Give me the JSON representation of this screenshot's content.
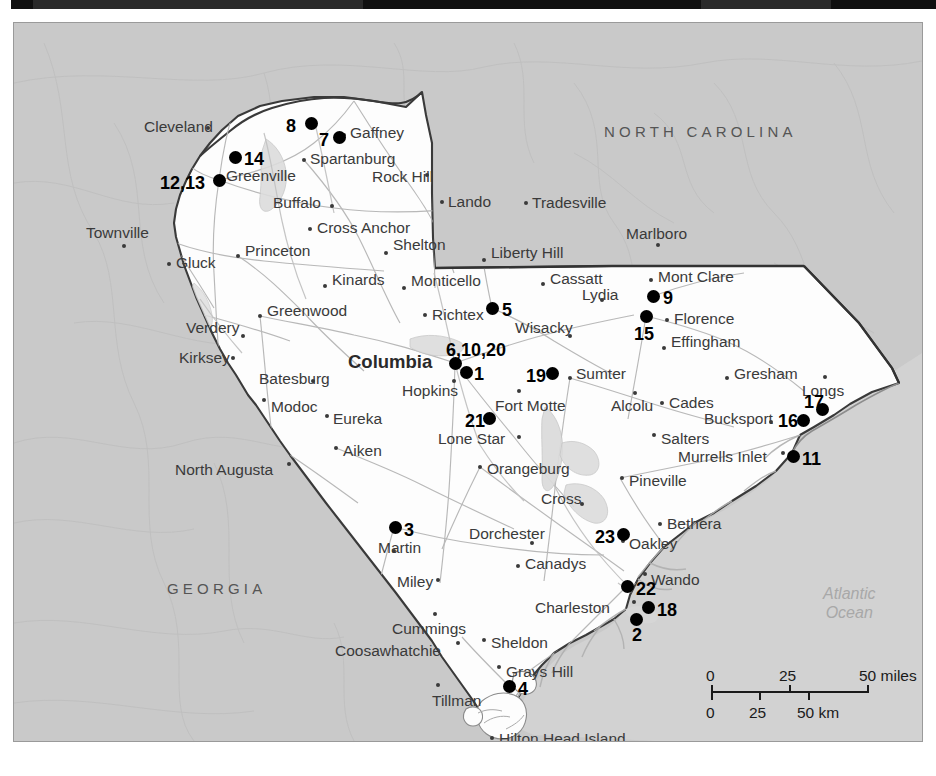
{
  "map": {
    "title": "South Carolina study-site locator map",
    "colors": {
      "land": "#ffffff",
      "surrounding": "#c9c9c9",
      "ocean": "#d6d6d6",
      "border": "#333333",
      "road": "#b9b9b9",
      "marker": "#000000",
      "label": "#3a3a3a"
    },
    "state_labels": [
      {
        "name": "NORTH CAROLINA",
        "x": 590,
        "y": 100
      },
      {
        "name": "GEORGIA",
        "x": 153,
        "y": 557
      }
    ],
    "ocean_label": {
      "line1": "Atlantic",
      "line2": "Ocean",
      "x": 809,
      "y": 561
    },
    "places": [
      {
        "name": "Cleveland",
        "x": 194,
        "y": 105,
        "align": "left",
        "tx": 130,
        "ty": 96
      },
      {
        "name": "Gaffney",
        "x": 330,
        "y": 112,
        "align": "left",
        "tx": 336,
        "ty": 102
      },
      {
        "name": "Spartanburg",
        "x": 290,
        "y": 137,
        "align": "left",
        "tx": 296,
        "ty": 128
      },
      {
        "name": "Greenville",
        "x": 206,
        "y": 155,
        "align": "left",
        "tx": 212,
        "ty": 145
      },
      {
        "name": "Rock Hill",
        "x": 413,
        "y": 152,
        "align": "left",
        "tx": 358,
        "ty": 146
      },
      {
        "name": "Buffalo",
        "x": 318,
        "y": 183,
        "align": "left",
        "tx": 259,
        "ty": 172
      },
      {
        "name": "Lando",
        "x": 428,
        "y": 179,
        "align": "left",
        "tx": 434,
        "ty": 171
      },
      {
        "name": "Tradesville",
        "x": 512,
        "y": 180,
        "align": "left",
        "tx": 518,
        "ty": 172
      },
      {
        "name": "Cross Anchor",
        "x": 296,
        "y": 206,
        "align": "left",
        "tx": 303,
        "ty": 197
      },
      {
        "name": "Marlboro",
        "x": 644,
        "y": 222,
        "align": "left",
        "tx": 612,
        "ty": 203
      },
      {
        "name": "Townville",
        "x": 110,
        "y": 223,
        "align": "left",
        "tx": 72,
        "ty": 202
      },
      {
        "name": "Shelton",
        "x": 372,
        "y": 230,
        "align": "left",
        "tx": 379,
        "ty": 214
      },
      {
        "name": "Liberty Hill",
        "x": 470,
        "y": 237,
        "align": "left",
        "tx": 477,
        "ty": 222
      },
      {
        "name": "Gluck",
        "x": 155,
        "y": 241,
        "align": "left",
        "tx": 162,
        "ty": 232
      },
      {
        "name": "Princeton",
        "x": 224,
        "y": 233,
        "align": "left",
        "tx": 231,
        "ty": 220
      },
      {
        "name": "Mont Clare",
        "x": 637,
        "y": 257,
        "align": "left",
        "tx": 644,
        "ty": 246
      },
      {
        "name": "Kinards",
        "x": 311,
        "y": 263,
        "align": "left",
        "tx": 318,
        "ty": 249
      },
      {
        "name": "Monticello",
        "x": 390,
        "y": 265,
        "align": "left",
        "tx": 397,
        "ty": 250
      },
      {
        "name": "Cassatt",
        "x": 529,
        "y": 261,
        "align": "left",
        "tx": 536,
        "ty": 248
      },
      {
        "name": "Lydia",
        "x": 588,
        "y": 277,
        "align": "left",
        "tx": 568,
        "ty": 264
      },
      {
        "name": "Greenwood",
        "x": 246,
        "y": 293,
        "align": "left",
        "tx": 253,
        "ty": 280
      },
      {
        "name": "Richtex",
        "x": 411,
        "y": 292,
        "align": "left",
        "tx": 418,
        "ty": 284
      },
      {
        "name": "Florence",
        "x": 653,
        "y": 297,
        "align": "left",
        "tx": 660,
        "ty": 288
      },
      {
        "name": "Verdery",
        "x": 229,
        "y": 313,
        "align": "left",
        "tx": 172,
        "ty": 297
      },
      {
        "name": "Wisacky",
        "x": 556,
        "y": 313,
        "align": "left",
        "tx": 501,
        "ty": 297
      },
      {
        "name": "Effingham",
        "x": 650,
        "y": 325,
        "align": "left",
        "tx": 657,
        "ty": 311
      },
      {
        "name": "Kirksey",
        "x": 219,
        "y": 335,
        "align": "left",
        "tx": 165,
        "ty": 327
      },
      {
        "name": "Batesburg",
        "x": 299,
        "y": 358,
        "align": "left",
        "tx": 245,
        "ty": 348
      },
      {
        "name": "Sumter",
        "x": 556,
        "y": 355,
        "align": "left",
        "tx": 562,
        "ty": 343
      },
      {
        "name": "Hopkins",
        "x": 440,
        "y": 358,
        "align": "left",
        "tx": 388,
        "ty": 360
      },
      {
        "name": "Gresham",
        "x": 713,
        "y": 355,
        "align": "left",
        "tx": 720,
        "ty": 343
      },
      {
        "name": "Longs",
        "x": 811,
        "y": 354,
        "align": "left",
        "tx": 788,
        "ty": 360
      },
      {
        "name": "Fort Motte",
        "x": 505,
        "y": 368,
        "align": "left",
        "tx": 481,
        "ty": 375
      },
      {
        "name": "Alcolu",
        "x": 621,
        "y": 370,
        "align": "left",
        "tx": 597,
        "ty": 375
      },
      {
        "name": "Cades",
        "x": 648,
        "y": 380,
        "align": "left",
        "tx": 655,
        "ty": 372
      },
      {
        "name": "Modoc",
        "x": 250,
        "y": 377,
        "align": "left",
        "tx": 257,
        "ty": 376
      },
      {
        "name": "Eureka",
        "x": 313,
        "y": 393,
        "align": "left",
        "tx": 319,
        "ty": 388
      },
      {
        "name": "Bucksport",
        "x": 757,
        "y": 399,
        "align": "left",
        "tx": 690,
        "ty": 388
      },
      {
        "name": "Lone Star",
        "x": 505,
        "y": 414,
        "align": "left",
        "tx": 424,
        "ty": 408
      },
      {
        "name": "Salters",
        "x": 640,
        "y": 412,
        "align": "left",
        "tx": 647,
        "ty": 408
      },
      {
        "name": "Aiken",
        "x": 322,
        "y": 425,
        "align": "left",
        "tx": 329,
        "ty": 420
      },
      {
        "name": "Murrells Inlet",
        "x": 769,
        "y": 430,
        "align": "left",
        "tx": 664,
        "ty": 426
      },
      {
        "name": "Orangeburg",
        "x": 466,
        "y": 444,
        "align": "left",
        "tx": 473,
        "ty": 438
      },
      {
        "name": "North Augusta",
        "x": 275,
        "y": 441,
        "align": "left",
        "tx": 161,
        "ty": 439
      },
      {
        "name": "Pineville",
        "x": 608,
        "y": 455,
        "align": "left",
        "tx": 615,
        "ty": 450
      },
      {
        "name": "Cross",
        "x": 568,
        "y": 481,
        "align": "left",
        "tx": 527,
        "ty": 468
      },
      {
        "name": "Bethera",
        "x": 646,
        "y": 501,
        "align": "left",
        "tx": 653,
        "ty": 493
      },
      {
        "name": "Dorchester",
        "x": 518,
        "y": 520,
        "align": "left",
        "tx": 455,
        "ty": 503
      },
      {
        "name": "Martin",
        "x": 380,
        "y": 528,
        "align": "left",
        "tx": 364,
        "ty": 517
      },
      {
        "name": "Oakley",
        "x": 609,
        "y": 518,
        "align": "left",
        "tx": 615,
        "ty": 513
      },
      {
        "name": "Canadys",
        "x": 504,
        "y": 543,
        "align": "left",
        "tx": 511,
        "ty": 533
      },
      {
        "name": "Miley",
        "x": 424,
        "y": 557,
        "align": "left",
        "tx": 383,
        "ty": 551
      },
      {
        "name": "Wando",
        "x": 631,
        "y": 551,
        "align": "left",
        "tx": 637,
        "ty": 549
      },
      {
        "name": "Charleston",
        "x": 620,
        "y": 579,
        "align": "left",
        "tx": 521,
        "ty": 577
      },
      {
        "name": "Cummings",
        "x": 421,
        "y": 591,
        "align": "left",
        "tx": 378,
        "ty": 598
      },
      {
        "name": "Coosawhatchie",
        "x": 444,
        "y": 620,
        "align": "left",
        "tx": 321,
        "ty": 620
      },
      {
        "name": "Sheldon",
        "x": 470,
        "y": 617,
        "align": "left",
        "tx": 477,
        "ty": 612
      },
      {
        "name": "Grays Hill",
        "x": 485,
        "y": 644,
        "align": "left",
        "tx": 492,
        "ty": 641
      },
      {
        "name": "Tillman",
        "x": 424,
        "y": 662,
        "align": "left",
        "tx": 418,
        "ty": 670
      },
      {
        "name": "Hilton Head Island",
        "x": 478,
        "y": 715,
        "align": "left",
        "tx": 485,
        "ty": 708
      }
    ],
    "sites": [
      {
        "id": "8",
        "x": 297,
        "y": 100,
        "lx": 272,
        "ly": 94
      },
      {
        "id": "7",
        "x": 325,
        "y": 114,
        "lx": 305,
        "ly": 108
      },
      {
        "id": "14",
        "x": 221,
        "y": 134,
        "lx": 230,
        "ly": 127
      },
      {
        "id": "12,13",
        "x": 205,
        "y": 157,
        "lx": 146,
        "ly": 151
      },
      {
        "id": "5",
        "x": 478,
        "y": 285,
        "lx": 488,
        "ly": 278
      },
      {
        "id": "9",
        "x": 639,
        "y": 273,
        "lx": 649,
        "ly": 266
      },
      {
        "id": "15",
        "x": 632,
        "y": 293,
        "lx": 620,
        "ly": 302
      },
      {
        "id": "6,10,20",
        "x": 441,
        "y": 340,
        "lx": 432,
        "ly": 318
      },
      {
        "id": "1",
        "x": 452,
        "y": 349,
        "lx": 460,
        "ly": 342
      },
      {
        "id": "19",
        "x": 538,
        "y": 350,
        "lx": 512,
        "ly": 344
      },
      {
        "id": "17",
        "x": 808,
        "y": 386,
        "lx": 790,
        "ly": 370
      },
      {
        "id": "16",
        "x": 789,
        "y": 397,
        "lx": 764,
        "ly": 389
      },
      {
        "id": "11",
        "x": 779,
        "y": 433,
        "lx": 788,
        "ly": 427
      },
      {
        "id": "21",
        "x": 475,
        "y": 395,
        "lx": 451,
        "ly": 389
      },
      {
        "id": "3",
        "x": 381,
        "y": 504,
        "lx": 390,
        "ly": 498
      },
      {
        "id": "23",
        "x": 609,
        "y": 511,
        "lx": 581,
        "ly": 505
      },
      {
        "id": "22",
        "x": 613,
        "y": 563,
        "lx": 622,
        "ly": 557
      },
      {
        "id": "18",
        "x": 634,
        "y": 584,
        "lx": 643,
        "ly": 578
      },
      {
        "id": "2",
        "x": 622,
        "y": 596,
        "lx": 618,
        "ly": 603
      },
      {
        "id": "4",
        "x": 495,
        "y": 663,
        "lx": 504,
        "ly": 657
      }
    ],
    "scale": {
      "x": 697,
      "y": 648,
      "miles_labels": [
        "0",
        "25",
        "50 miles"
      ],
      "km_labels": [
        "0",
        "25",
        "50 km"
      ]
    }
  }
}
